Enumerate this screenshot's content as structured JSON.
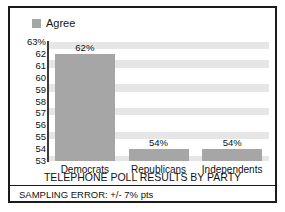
{
  "chart_data": {
    "type": "bar",
    "title": "TELEPHONE POLL RESULTS BY PARTY",
    "xlabel": "",
    "ylabel": "",
    "categories": [
      "Democrats",
      "Republicans",
      "Independents"
    ],
    "values": [
      62,
      54,
      54
    ],
    "value_labels": [
      "62%",
      "54%",
      "54%"
    ],
    "ylim": [
      53,
      63
    ],
    "yticks": [
      63,
      62,
      61,
      60,
      59,
      58,
      57,
      56,
      55,
      54,
      53
    ],
    "ytick_labels": [
      "63%",
      "62",
      "61",
      "60",
      "59",
      "58",
      "57",
      "56",
      "55",
      "54",
      "53"
    ],
    "grid": "alternating-horizontal-bands",
    "legend": {
      "position": "top-left",
      "entries": [
        {
          "label": "Agree",
          "color": "#a6a6a6"
        }
      ]
    },
    "series": [
      {
        "name": "Agree",
        "color": "#a6a6a6",
        "values": [
          62,
          54,
          54
        ]
      }
    ],
    "annotations": [
      "SAMPLING ERROR: +/- 7% pts"
    ]
  },
  "legend": {
    "label": "Agree"
  },
  "axis": {
    "ticks": [
      "63%",
      "62",
      "61",
      "60",
      "59",
      "58",
      "57",
      "56",
      "55",
      "54",
      "53"
    ]
  },
  "bars": [
    {
      "category": "Democrats",
      "value_label": "62%"
    },
    {
      "category": "Republicans",
      "value_label": "54%"
    },
    {
      "category": "Independents",
      "value_label": "54%"
    }
  ],
  "footer": {
    "title": "TELEPHONE POLL RESULTS BY PARTY",
    "sampling_error": "SAMPLING ERROR: +/- 7% pts"
  },
  "colors": {
    "bar": "#a6a6a6",
    "band": "#e6e6e6",
    "frame": "#1b1b1b",
    "text": "#111111"
  }
}
